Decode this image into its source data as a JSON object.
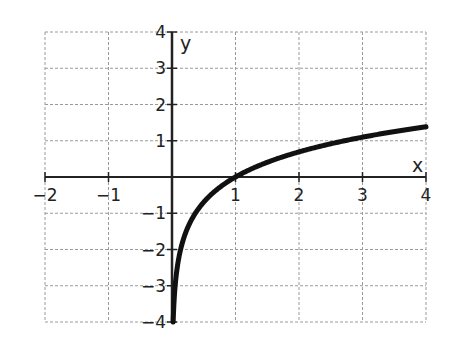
{
  "chart_data": {
    "type": "line",
    "title": "",
    "function": "y = ln(x)",
    "xlabel": "x",
    "ylabel": "y",
    "xlim": [
      -2,
      4
    ],
    "ylim": [
      -4,
      4
    ],
    "grid": true,
    "x_ticks": [
      "−2",
      "−1",
      "1",
      "2",
      "3",
      "4"
    ],
    "y_ticks": [
      "4",
      "3",
      "2",
      "1",
      "−1",
      "−2",
      "−3",
      "−4"
    ],
    "series": [
      {
        "name": "curve",
        "x": [
          0.0183,
          0.05,
          0.1,
          0.2,
          0.3,
          0.5,
          0.75,
          1,
          1.5,
          2,
          2.5,
          3,
          3.5,
          4
        ],
        "y": [
          -4,
          -3.0,
          -2.3,
          -1.61,
          -1.2,
          -0.69,
          -0.29,
          0,
          0.41,
          0.69,
          0.92,
          1.1,
          1.25,
          1.39
        ]
      }
    ],
    "annotations": []
  }
}
